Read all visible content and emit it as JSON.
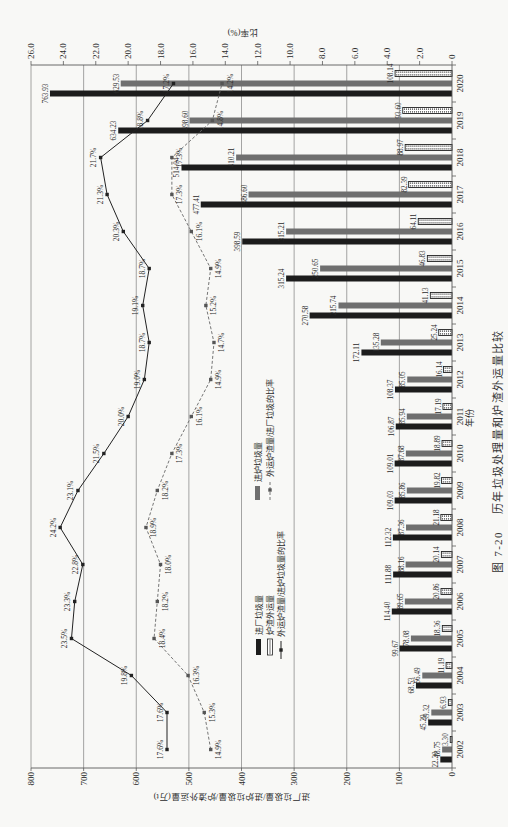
{
  "figure": {
    "number": "图 7-20",
    "title": "历年垃圾处理量和炉渣外运量比较"
  },
  "chart_data": {
    "type": "bar",
    "title": "历年垃圾处理量和炉渣外运量比较",
    "orientation_note": "page rotated 90° counter-clockwise",
    "xlabel": "年份",
    "ylabel": "进厂垃圾量/进炉垃圾量/炉渣外运量(万t)",
    "y2label": "比率(%)",
    "ylim": [
      0,
      800
    ],
    "y2lim": [
      0,
      26
    ],
    "yticks": [
      0,
      100,
      200,
      300,
      400,
      500,
      600,
      700,
      800
    ],
    "y2ticks": [
      "0",
      "2.0",
      "4.0",
      "6.0",
      "8.0",
      "10.0",
      "12.0",
      "14.0",
      "16.0",
      "18.0",
      "20.0",
      "22.0",
      "24.0",
      "26.0"
    ],
    "grid": true,
    "legend_position": "upper-left (inside plot)",
    "categories": [
      "2002",
      "2003",
      "2004",
      "2005",
      "2006",
      "2007",
      "2008",
      "2009",
      "2010",
      "2011",
      "2012",
      "2013",
      "2014",
      "2015",
      "2016",
      "2017",
      "2018",
      "2019",
      "2020"
    ],
    "series": [
      {
        "name": "进厂垃圾量",
        "type": "bar",
        "axis": "left",
        "color": "#1c1c1c",
        "values": [
          22.2,
          45.29,
          68.53,
          99.67,
          114.4,
          111.88,
          112.32,
          109.03,
          109.01,
          106.87,
          108.37,
          172.11,
          270.58,
          315.24,
          398.59,
          477.41,
          514.04,
          634.23,
          763.93
        ]
      },
      {
        "name": "进炉垃圾量",
        "type": "bar",
        "axis": "left",
        "color": "#6f6f6f",
        "values": [
          18.75,
          39.32,
          56.49,
          78.08,
          89.65,
          88.16,
          87.36,
          85.86,
          87.68,
          85.94,
          85.05,
          135.28,
          215.74,
          250.65,
          315.21,
          386.6,
          410.21,
          498.6,
          629.53
        ]
      },
      {
        "name": "炉渣外运量",
        "type": "bar",
        "axis": "left",
        "color": "#ffffff",
        "pattern": "dotted",
        "values": [
          3.3,
          6.93,
          11.19,
          18.36,
          20.86,
          20.14,
          21.18,
          19.82,
          18.89,
          17.19,
          16.14,
          25.24,
          41.13,
          46.83,
          64.11,
          82.39,
          88.97,
          93.6,
          108.14
        ]
      },
      {
        "name": "外运炉渣量/进炉垃圾量的比率",
        "type": "line",
        "axis": "right",
        "style": "solid",
        "color": "#222222",
        "unit": "%",
        "values": [
          17.6,
          17.6,
          19.8,
          23.5,
          23.3,
          22.8,
          24.2,
          23.1,
          21.5,
          20.0,
          19.0,
          18.7,
          19.1,
          18.7,
          20.3,
          21.3,
          21.7,
          18.8,
          17.2
        ]
      },
      {
        "name": "外运炉渣量/进厂垃圾的比率",
        "type": "line",
        "axis": "right",
        "style": "dashed",
        "color": "#666666",
        "unit": "%",
        "values": [
          14.9,
          15.3,
          16.3,
          18.4,
          18.2,
          18.0,
          18.9,
          18.2,
          17.3,
          16.1,
          14.9,
          14.7,
          15.2,
          14.9,
          16.1,
          17.3,
          17.3,
          14.8,
          14.2
        ]
      }
    ]
  }
}
